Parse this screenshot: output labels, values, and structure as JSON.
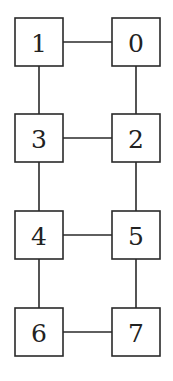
{
  "diagram": {
    "type": "graph",
    "layout": "2-column ladder",
    "nodes": [
      {
        "id": "1",
        "label": "1",
        "col": 0,
        "row": 0
      },
      {
        "id": "0",
        "label": "0",
        "col": 1,
        "row": 0
      },
      {
        "id": "3",
        "label": "3",
        "col": 0,
        "row": 1
      },
      {
        "id": "2",
        "label": "2",
        "col": 1,
        "row": 1
      },
      {
        "id": "4",
        "label": "4",
        "col": 0,
        "row": 2
      },
      {
        "id": "5",
        "label": "5",
        "col": 1,
        "row": 2
      },
      {
        "id": "6",
        "label": "6",
        "col": 0,
        "row": 3
      },
      {
        "id": "7",
        "label": "7",
        "col": 1,
        "row": 3
      }
    ],
    "edges": [
      [
        "1",
        "0"
      ],
      [
        "1",
        "3"
      ],
      [
        "0",
        "2"
      ],
      [
        "3",
        "2"
      ],
      [
        "3",
        "4"
      ],
      [
        "2",
        "5"
      ],
      [
        "4",
        "5"
      ],
      [
        "4",
        "6"
      ],
      [
        "5",
        "7"
      ],
      [
        "6",
        "7"
      ]
    ],
    "colors": {
      "stroke": "#2a2a2a",
      "fill": "#ffffff",
      "text": "#222222"
    }
  }
}
